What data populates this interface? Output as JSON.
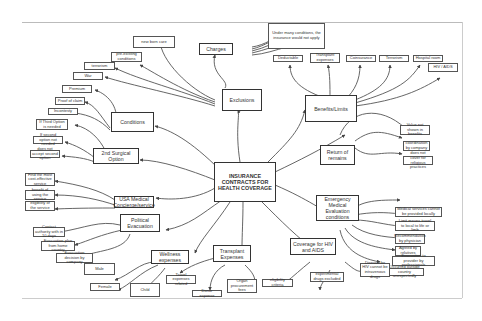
{
  "diagram": {
    "type": "mind-map",
    "center": "INSURANCE CONTRACTS FOR HEALTH COVERAGE",
    "branches": [
      {
        "id": "exclusions",
        "label": "Exclusions",
        "children": [
          "new born care",
          "pre-existing conditions",
          "terrorism",
          "War"
        ]
      },
      {
        "id": "charges",
        "label": "Charges",
        "children": [
          "Under many conditions, the insurance would not apply"
        ]
      },
      {
        "id": "benefits",
        "label": "Benefits/Limits",
        "children": [
          "Deductable",
          "Transplant expenses",
          "Coinsurance",
          "Terrorism",
          "Hospital room",
          "HIV / AIDS"
        ]
      },
      {
        "id": "conditions",
        "label": "Conditions",
        "children": [
          "Premium",
          "Proof of claim",
          "Incontesty"
        ]
      },
      {
        "id": "surgical",
        "label": "2nd Surgical Option",
        "children": [
          "If Third Option is needed",
          "If second option not needed",
          "does not accept second option"
        ]
      },
      {
        "id": "return",
        "label": "Return of remains",
        "children": [
          "Value not shown in benefits",
          "coordination by company",
          "does not cover for religious practices"
        ]
      },
      {
        "id": "usa",
        "label": "USA Medical Concierge/service",
        "children": [
          "Find the most cost-effective service",
          "benefit of using the service",
          "eligibility of the service"
        ]
      },
      {
        "id": "emergency",
        "label": "Emergency Medical Evaluation conditions",
        "children": [
          "Medical services cannot be provided locally",
          "Limit means travel to local to life or limb",
          "Recommendation by physician",
          "Agreed by relatives",
          "Evacuation to provider by professionals",
          "Occurred outside country unexpectedly"
        ]
      },
      {
        "id": "political",
        "label": "Political Evacuation",
        "children": [
          "Contact authority with in 10 days",
          "Evacuation plan from home country",
          "Evacuation decision by company"
        ]
      },
      {
        "id": "wellness",
        "label": "Wellness expenses",
        "children": [
          "Male",
          "Female",
          "Child"
        ]
      },
      {
        "id": "transplant",
        "label": "Transplant Expenses",
        "children": [
          "Travel expenses related",
          "Donor expense",
          "Organ procurement fees"
        ]
      },
      {
        "id": "hiv",
        "label": "Coverage for HIV and AIDS",
        "children": [
          "eligibility criteria",
          "experimental drugs excluded",
          "Disease for HIV cannot be intravenous drugs"
        ]
      }
    ]
  },
  "nodes": {
    "center": "INSURANCE CONTRACTS FOR HEALTH COVERAGE",
    "exclusions": "Exclusions",
    "new_born_care": "new born care",
    "pre_existing": "pre-existing conditions",
    "terrorism_ex": "terrorism",
    "war": "War",
    "charges": "Charges",
    "under_many": "Under many conditions, the insurance would not apply",
    "benefits": "Benefits/Limits",
    "deductable": "Deductable",
    "transplant_exp": "Transplant expenses",
    "coinsurance": "Coinsurance",
    "terrorism_b": "Terrorism",
    "hospital_room": "Hospital room",
    "hiv_aids": "HIV / AIDS",
    "conditions": "Conditions",
    "premium": "Premium",
    "proof_claim": "Proof of claim",
    "incontesty": "Incontesty",
    "surgical": "2nd Surgical Option",
    "third_option": "If Third Option is needed",
    "second_not_needed": "If second option not needed",
    "not_accept": "does not accept second option",
    "return": "Return of remains",
    "value_not_shown": "Value not shown in benefits",
    "coordination": "coordination by company",
    "religious": "does not cover for religious practices",
    "usa": "USA Medical Concierge/service",
    "cost_effective": "Find the most cost-effective service",
    "benefit_using": "benefit of using the service",
    "eligibility_service": "eligibility of the service",
    "emergency": "Emergency Medical Evaluation conditions",
    "em_locally": "Medical services cannot be provided locally",
    "em_limit": "Limit means travel to local to life or limb",
    "em_recommend": "Recommendation by physician",
    "em_agreed": "Agreed by relatives",
    "em_evac": "Evacuation to provider by professionals",
    "em_outside": "Occurred outside country unexpectedly",
    "political": "Political Evacuation",
    "pol_contact": "Contact authority with in 10 days",
    "pol_plan": "Evacuation plan from home country",
    "pol_decision": "Evacuation decision by company",
    "wellness": "Wellness expenses",
    "male": "Male",
    "female": "Female",
    "child": "Child",
    "transplant": "Transplant Expenses",
    "travel_exp": "Travel expenses related",
    "donor": "Donor expense",
    "organ": "Organ procurement fees",
    "hiv": "Coverage for HIV and AIDS",
    "eligibility": "eligibility criteria",
    "experimental": "experimental drugs excluded",
    "disease_hiv": "Disease for HIV cannot be intravenous drugs"
  },
  "colors": {
    "line": "#444444",
    "border": "#333333",
    "background": "#ffffff",
    "frame": "#bbbbbb"
  }
}
